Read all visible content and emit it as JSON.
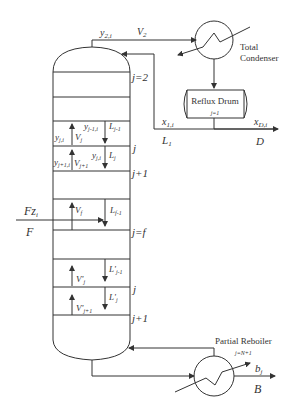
{
  "diagram": {
    "type": "distillation-column-schematic",
    "condenser": {
      "label_line1": "Total",
      "label_line2": "Condenser"
    },
    "reflux_drum": {
      "label": "Reflux Drum",
      "stage": "j=1"
    },
    "reboiler": {
      "label": "Partial Reboiler",
      "stage": "j=N+1"
    },
    "top_stream": {
      "composition": "y",
      "composition_sub": "2,i",
      "flow": "V",
      "flow_sub": "2"
    },
    "reflux": {
      "composition": "x",
      "composition_sub": "1,i",
      "flow": "L",
      "flow_sub": "1"
    },
    "distillate": {
      "composition": "x",
      "composition_sub": "D,i",
      "flow": "D"
    },
    "bottoms": {
      "composition": "b",
      "composition_sub": "j",
      "flow": "B"
    },
    "feed": {
      "label_top": "Fz",
      "label_top_sub": "i",
      "label_bottom": "F"
    },
    "stage_labels": {
      "j2": "j=2",
      "j_upper": "j",
      "j1_upper": "j+1",
      "jf": "j=f",
      "j_lower": "j",
      "j1_lower": "j+1"
    },
    "rectifying": {
      "y_j_i": {
        "base": "y",
        "sub": "j,i"
      },
      "V_j": {
        "base": "V",
        "sub": "j"
      },
      "y_jm1_i": {
        "base": "y",
        "sub": "j-1,i"
      },
      "L_jm1": {
        "base": "L",
        "sub": "j-1"
      },
      "y_jp1_i": {
        "base": "y",
        "sub": "j+1,i"
      },
      "V_jp1": {
        "base": "V",
        "sub": "j+1"
      },
      "y_j_i_2": {
        "base": "y",
        "sub": "j,i"
      },
      "L_j": {
        "base": "L",
        "sub": "j"
      }
    },
    "feed_stage": {
      "V_f": {
        "base": "V",
        "sub": "f"
      },
      "L_fm1": {
        "base": "L",
        "sub": "f-1"
      }
    },
    "stripping": {
      "Vp_j": {
        "base": "V'",
        "sub": "j"
      },
      "Lp_jm1": {
        "base": "L'",
        "sub": "j-1"
      },
      "Vp_jp1": {
        "base": "V'",
        "sub": "j+1"
      },
      "Lp_j": {
        "base": "L'",
        "sub": "j"
      }
    }
  }
}
